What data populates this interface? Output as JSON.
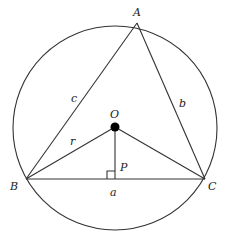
{
  "diagram": {
    "colors": {
      "line": "#333333",
      "text": "#222222",
      "center_dot": "#000000",
      "background": "#ffffff"
    },
    "circle": {
      "cx": 115,
      "cy": 128,
      "r": 102
    },
    "points": {
      "A": {
        "x": 137,
        "y": 23
      },
      "B": {
        "x": 26,
        "y": 179
      },
      "C": {
        "x": 205,
        "y": 179
      },
      "O": {
        "x": 115,
        "y": 127
      },
      "P": {
        "x": 115,
        "y": 179
      }
    },
    "labels": {
      "A": "A",
      "B": "B",
      "C": "C",
      "O": "O",
      "P": "P",
      "side_a": "a",
      "side_b": "b",
      "side_c": "c",
      "radius": "r"
    },
    "segments": [
      {
        "name": "side-ab",
        "from": "A",
        "to": "B"
      },
      {
        "name": "side-ac",
        "from": "A",
        "to": "C"
      },
      {
        "name": "side-bc",
        "from": "B",
        "to": "C"
      },
      {
        "name": "radius-ob",
        "from": "O",
        "to": "B"
      },
      {
        "name": "radius-oc",
        "from": "O",
        "to": "C"
      },
      {
        "name": "perpendicular-op",
        "from": "O",
        "to": "P"
      }
    ],
    "right_angle_marker": {
      "at": "P",
      "size": 8,
      "side": "left"
    }
  }
}
